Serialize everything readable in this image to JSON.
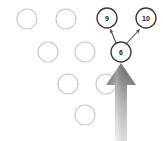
{
  "diagram": {
    "type": "node-graph-with-pointer",
    "canvas": {
      "width": 163,
      "height": 141,
      "background": "#ffffff"
    },
    "colors": {
      "empty_node_stroke": "#c8c8c8",
      "labeled_node_stroke": "#3a3a3a",
      "node_fill": "#ffffff",
      "edge_stroke": "#4a4a4a",
      "pointer_dark": "#808080",
      "pointer_light": "#e6e6e6"
    },
    "empty_nodes": [
      {
        "name": "node-r1-c1",
        "cx": 27,
        "cy": 19,
        "r": 10
      },
      {
        "name": "node-r1-c2",
        "cx": 66,
        "cy": 19,
        "r": 10
      },
      {
        "name": "node-r2-c1",
        "cx": 48,
        "cy": 52,
        "r": 10
      },
      {
        "name": "node-r2-c2",
        "cx": 85,
        "cy": 52,
        "r": 10
      },
      {
        "name": "node-r3-c1",
        "cx": 68,
        "cy": 84,
        "r": 10
      },
      {
        "name": "node-r3-c2",
        "cx": 106,
        "cy": 84,
        "r": 10
      },
      {
        "name": "node-r4-c1",
        "cx": 85,
        "cy": 115,
        "r": 10
      }
    ],
    "labeled_nodes": [
      {
        "name": "node-9",
        "label": "9",
        "cx": 107,
        "cy": 18,
        "r": 10
      },
      {
        "name": "node-10",
        "label": "10",
        "cx": 146,
        "cy": 18,
        "r": 10
      },
      {
        "name": "node-6",
        "label": "6",
        "cx": 121,
        "cy": 52,
        "r": 10
      }
    ],
    "edges": [
      {
        "name": "edge-6-to-9",
        "from": "6",
        "to": "9",
        "x1": 116,
        "y1": 43,
        "x2": 110,
        "y2": 29
      },
      {
        "name": "edge-6-to-10",
        "from": "6",
        "to": "10",
        "x1": 127,
        "y1": 43,
        "x2": 140,
        "y2": 29
      }
    ],
    "pointer": {
      "name": "big-up-arrow",
      "target_node": "6",
      "tip_x": 121,
      "tip_y": 63,
      "shaft_bottom_y": 141,
      "head_half_width": 15,
      "shaft_half_width": 6,
      "head_height": 22
    }
  }
}
